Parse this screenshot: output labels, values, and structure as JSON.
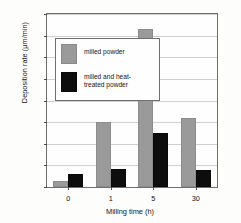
{
  "chart_data": {
    "type": "bar",
    "title": "",
    "xlabel": "Milling time (h)",
    "ylabel": "Deposition rate (µm/min)",
    "categories": [
      "0",
      "1",
      "5",
      "30"
    ],
    "ylim": [
      0,
      80
    ],
    "yticks": [
      0,
      10,
      20,
      30,
      40,
      50,
      60,
      70,
      80
    ],
    "ytick_labels": [
      "",
      "10",
      "20",
      "30",
      "40",
      "50",
      "60",
      "70",
      "80"
    ],
    "grid": true,
    "legend_position": "upper-left-inset",
    "series": [
      {
        "name": "milled powder",
        "color": "#9a9a9a",
        "values": [
          3,
          30,
          73,
          32
        ]
      },
      {
        "name": "milled and heat-treated powder",
        "color": "#0d0d0d",
        "values": [
          6,
          8.5,
          25,
          8
        ]
      }
    ]
  },
  "legend": {
    "entries": [
      {
        "label": "milled powder",
        "line1": "milled powder",
        "line2": ""
      },
      {
        "label": "milled and heat-treated powder",
        "line1": "milled and heat-",
        "line2": "treated powder"
      }
    ]
  }
}
